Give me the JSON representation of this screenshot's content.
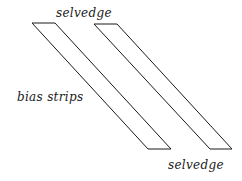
{
  "diagram": {
    "labels": {
      "top": "selvedge",
      "side": "bias strips",
      "bottom": "selvedge"
    },
    "strips": [
      {
        "name": "strip-1",
        "top_left": [
          32,
          23
        ],
        "top_right": [
          55,
          23
        ],
        "bottom_left": [
          148,
          149
        ],
        "bottom_right": [
          171,
          149
        ]
      },
      {
        "name": "strip-2",
        "top_left": [
          94,
          24
        ],
        "top_right": [
          117,
          24
        ],
        "bottom_left": [
          210,
          149
        ],
        "bottom_right": [
          232,
          149
        ]
      }
    ],
    "stroke_color": "#1a1a1a",
    "background": "#ffffff"
  }
}
